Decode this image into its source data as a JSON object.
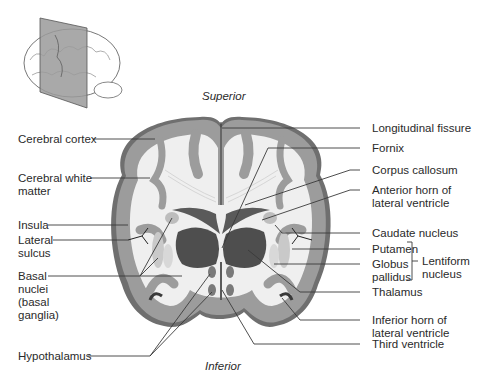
{
  "figure": {
    "orientation": {
      "top": "Superior",
      "bottom": "Inferior"
    },
    "colors": {
      "gray_matter": "#8e8e8e",
      "cortex_outer": "#9a9a9a",
      "white_matter": "#efefef",
      "ventricle": "#5a5a5a",
      "thalamus": "#4e4e4e",
      "leader_line": "#3a3a3a"
    },
    "left_labels": [
      {
        "id": "cerebral-cortex",
        "text": "Cerebral cortex"
      },
      {
        "id": "cerebral-white-matter",
        "lines": [
          "Cerebral white",
          "matter"
        ]
      },
      {
        "id": "insula",
        "text": "Insula"
      },
      {
        "id": "lateral-sulcus",
        "lines": [
          "Lateral",
          "sulcus"
        ]
      },
      {
        "id": "basal-nuclei",
        "lines": [
          "Basal",
          "nuclei",
          "(basal",
          "ganglia)"
        ]
      },
      {
        "id": "hypothalamus",
        "text": "Hypothalamus"
      }
    ],
    "right_labels": [
      {
        "id": "longitudinal-fissure",
        "text": "Longitudinal fissure"
      },
      {
        "id": "fornix",
        "text": "Fornix"
      },
      {
        "id": "corpus-callosum",
        "text": "Corpus callosum"
      },
      {
        "id": "anterior-horn",
        "lines": [
          "Anterior horn of",
          "lateral ventricle"
        ]
      },
      {
        "id": "caudate-nucleus",
        "text": "Caudate nucleus"
      },
      {
        "id": "putamen",
        "text": "Putamen"
      },
      {
        "id": "globus-pallidus",
        "lines": [
          "Globus",
          "pallidus"
        ]
      },
      {
        "id": "thalamus",
        "text": "Thalamus"
      },
      {
        "id": "inferior-horn",
        "lines": [
          "Inferior horn of",
          "lateral ventricle"
        ]
      },
      {
        "id": "third-ventricle",
        "text": "Third ventricle"
      }
    ],
    "bracket_label": {
      "id": "lentiform-nucleus",
      "lines": [
        "Lentiform",
        "nucleus"
      ]
    }
  }
}
